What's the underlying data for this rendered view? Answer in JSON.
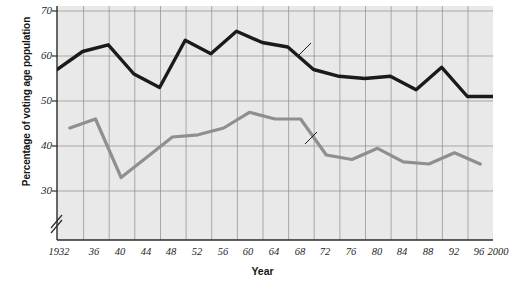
{
  "chart_data": {
    "type": "line",
    "title": "",
    "xlabel": "Year",
    "ylabel": "Percentage of voting age population",
    "xlim": [
      1932,
      2000
    ],
    "ylim": [
      26,
      70
    ],
    "yticks": [
      30,
      40,
      50,
      60,
      70
    ],
    "ytick_labels": [
      "30",
      "40",
      "50",
      "60",
      "70"
    ],
    "xticks": [
      1932,
      1936,
      1940,
      1944,
      1948,
      1952,
      1956,
      1960,
      1964,
      1968,
      1972,
      1976,
      1980,
      1984,
      1988,
      1992,
      1996,
      2000
    ],
    "xtick_labels": [
      "1932",
      "36",
      "40",
      "44",
      "48",
      "52",
      "56",
      "60",
      "64",
      "68",
      "72",
      "76",
      "80",
      "84",
      "88",
      "92",
      "96",
      "2000"
    ],
    "grid": true,
    "legend_position": "inline-annotation",
    "axis_break": true,
    "series": [
      {
        "name": "Presidential elections",
        "color": "#1a1a1a",
        "x": [
          1932,
          1936,
          1940,
          1944,
          1948,
          1952,
          1956,
          1960,
          1964,
          1968,
          1972,
          1976,
          1980,
          1984,
          1988,
          1992,
          1996,
          2000
        ],
        "values": [
          57.0,
          61.0,
          62.5,
          56.0,
          53.0,
          63.5,
          60.5,
          65.5,
          63.0,
          62.0,
          57.0,
          55.5,
          55.0,
          55.5,
          52.5,
          57.5,
          51.0,
          51.0
        ]
      },
      {
        "name": "Midterm House elections",
        "color": "#8f8f8f",
        "x": [
          1934,
          1938,
          1942,
          1946,
          1950,
          1954,
          1958,
          1962,
          1966,
          1970,
          1974,
          1978,
          1982,
          1986,
          1990,
          1994,
          1998
        ],
        "values": [
          44.0,
          46.0,
          33.0,
          37.5,
          42.0,
          42.5,
          44.0,
          47.5,
          46.0,
          46.0,
          38.0,
          37.0,
          39.5,
          36.5,
          36.0,
          38.5,
          36.0
        ]
      }
    ],
    "annotations": [
      {
        "text": "Presidential elections",
        "x": 1977,
        "y": 64.0
      },
      {
        "text": "Midterm House elections",
        "x": 1976,
        "y": 44.5
      }
    ]
  },
  "axis": {
    "break_symbol": "axis-break-slashes"
  }
}
